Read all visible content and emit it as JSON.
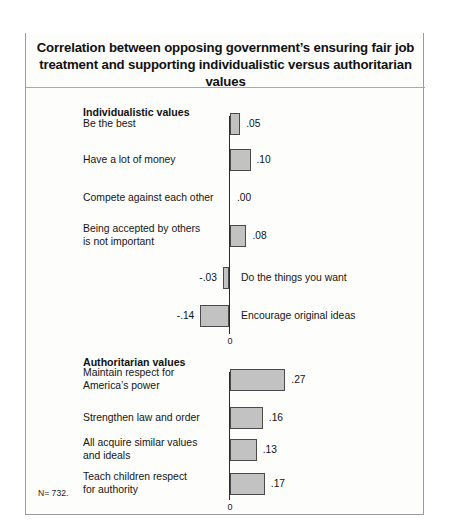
{
  "figure": {
    "title": "Correlation between opposing government’s ensuring fair job treatment and supporting individualistic versus authoritarian values",
    "title_line1": "Correlation between opposing government’s ensuring fair job",
    "title_line2": "treatment and supporting individualistic versus authoritarian values",
    "footnote": "N= 732.",
    "axis_zero_label": "0",
    "colors": {
      "bar_fill": "#c2c2c2",
      "bar_stroke": "#4a4a4a",
      "frame": "#9b9b9b",
      "top_rule": "#1a1a1a",
      "text": "#111111",
      "background": "#fdfdfc"
    }
  },
  "groups": [
    {
      "heading": "Individualistic values",
      "items": [
        {
          "label": "Be the best",
          "label_lines": [
            "Be the best"
          ],
          "value": 0.05,
          "value_label": ".05"
        },
        {
          "label": "Have a lot of money",
          "label_lines": [
            "Have a lot of money"
          ],
          "value": 0.1,
          "value_label": ".10"
        },
        {
          "label": "Compete against each other",
          "label_lines": [
            "Compete against each other"
          ],
          "value": 0.0,
          "value_label": ".00"
        },
        {
          "label": "Being accepted by others is not important",
          "label_lines": [
            "Being accepted by others",
            "is not important"
          ],
          "value": 0.08,
          "value_label": ".08"
        },
        {
          "label": "Do the things you want",
          "label_lines": [
            "Do the things you want"
          ],
          "value": -0.03,
          "value_label": "-.03"
        },
        {
          "label": "Encourage original ideas",
          "label_lines": [
            "Encourage original ideas"
          ],
          "value": -0.14,
          "value_label": "-.14"
        }
      ]
    },
    {
      "heading": "Authoritarian values",
      "items": [
        {
          "label": "Maintain respect for America’s power",
          "label_lines": [
            "Maintain respect for",
            "America’s power"
          ],
          "value": 0.27,
          "value_label": ".27"
        },
        {
          "label": "Strengthen law and order",
          "label_lines": [
            "Strengthen law and order"
          ],
          "value": 0.16,
          "value_label": ".16"
        },
        {
          "label": "All acquire similar values and ideals",
          "label_lines": [
            "All acquire similar values",
            "and ideals"
          ],
          "value": 0.13,
          "value_label": ".13"
        },
        {
          "label": "Teach children respect for authority",
          "label_lines": [
            "Teach children respect",
            "for authority"
          ],
          "value": 0.17,
          "value_label": ".17"
        }
      ]
    }
  ],
  "chart_data": {
    "type": "bar",
    "orientation": "horizontal",
    "title": "Correlation between opposing government’s ensuring fair job treatment and supporting individualistic versus authoritarian values",
    "xlabel": "",
    "ylabel": "",
    "xlim": [
      -0.2,
      0.32
    ],
    "grid": false,
    "legend": null,
    "note": "N= 732.",
    "units": "correlation coefficient",
    "panels": [
      {
        "name": "Individualistic values",
        "categories": [
          "Be the best",
          "Have a lot of money",
          "Compete against each other",
          "Being accepted by others is not important",
          "Do the things you want",
          "Encourage original ideas"
        ],
        "values": [
          0.05,
          0.1,
          0.0,
          0.08,
          -0.03,
          -0.14
        ],
        "value_labels": [
          ".05",
          ".10",
          ".00",
          ".08",
          "-.03",
          "-.14"
        ]
      },
      {
        "name": "Authoritarian values",
        "categories": [
          "Maintain respect for America’s power",
          "Strengthen law and order",
          "All acquire similar values and ideals",
          "Teach children respect for authority"
        ],
        "values": [
          0.27,
          0.16,
          0.13,
          0.17
        ],
        "value_labels": [
          ".27",
          ".16",
          ".13",
          ".17"
        ]
      }
    ]
  }
}
